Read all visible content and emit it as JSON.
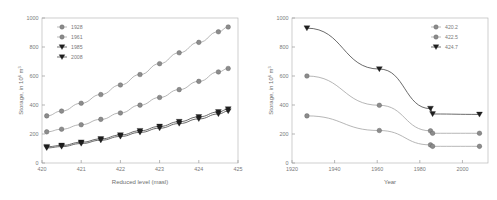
{
  "figure": {
    "background": "#ffffff",
    "axis_color": "#9a9a9a",
    "text_color": "#6e6e6e"
  },
  "chart_data": [
    {
      "id": "left",
      "type": "line",
      "title": "",
      "xlabel": "Reduced level (masl)",
      "ylabel": "Storage, in 10  m",
      "ylabel_sup1": "6",
      "ylabel_sup2": "3",
      "xlim": [
        420,
        425
      ],
      "ylim": [
        0,
        1000
      ],
      "xticks": [
        420,
        421,
        422,
        423,
        424,
        425
      ],
      "xtick_labels": [
        "420",
        "421",
        "422",
        "423",
        "424",
        "425"
      ],
      "yticks": [
        0,
        200,
        400,
        600,
        800,
        1000
      ],
      "ytick_labels": [
        "0",
        "200",
        "400",
        "600",
        "800",
        "1000"
      ],
      "grid": false,
      "legend_position": "top-left",
      "x": [
        420.12,
        420.5,
        421.0,
        421.5,
        422.0,
        422.5,
        423.0,
        423.5,
        424.0,
        424.5,
        424.75
      ],
      "series": [
        {
          "name": "1928",
          "marker": "circle",
          "color": "#8c8c8c",
          "values": [
            325,
            358,
            412,
            472,
            538,
            610,
            685,
            760,
            832,
            905,
            938
          ]
        },
        {
          "name": "1961",
          "marker": "circle",
          "color": "#8c8c8c",
          "values": [
            215,
            233,
            264,
            301,
            345,
            399,
            452,
            506,
            563,
            628,
            652
          ]
        },
        {
          "name": "1985",
          "marker": "triangle",
          "color": "#1f1f1f",
          "values": [
            112,
            121,
            143,
            166,
            193,
            222,
            252,
            285,
            318,
            352,
            372
          ]
        },
        {
          "name": "2008",
          "marker": "triangle",
          "color": "#1f1f1f",
          "values": [
            104,
            113,
            134,
            157,
            183,
            211,
            240,
            272,
            304,
            338,
            358
          ]
        }
      ]
    },
    {
      "id": "right",
      "type": "line",
      "title": "",
      "xlabel": "Year",
      "ylabel": "Storage, in 10  m",
      "ylabel_sup1": "6",
      "ylabel_sup2": "3",
      "xlim": [
        1920,
        2012
      ],
      "ylim": [
        0,
        1000
      ],
      "xticks": [
        1920,
        1940,
        1960,
        1980,
        2000
      ],
      "xtick_labels": [
        "1920",
        "1940",
        "1960",
        "1980",
        "2000"
      ],
      "yticks": [
        0,
        200,
        400,
        600,
        800,
        1000
      ],
      "ytick_labels": [
        "0",
        "200",
        "400",
        "600",
        "800",
        "1000"
      ],
      "grid": false,
      "legend_position": "top-right",
      "x": [
        1927,
        1961,
        1985,
        1986,
        2008
      ],
      "series": [
        {
          "name": "424.7",
          "marker": "triangle",
          "color": "#1f1f1f",
          "values": [
            930,
            648,
            375,
            338,
            335
          ]
        },
        {
          "name": "422.5",
          "marker": "circle",
          "color": "#8c8c8c",
          "values": [
            600,
            398,
            222,
            205,
            205
          ]
        },
        {
          "name": "420.2",
          "marker": "circle",
          "color": "#8c8c8c",
          "values": [
            325,
            224,
            125,
            115,
            115
          ]
        }
      ],
      "legend_order": [
        "420.2",
        "422.5",
        "424.7"
      ]
    }
  ]
}
